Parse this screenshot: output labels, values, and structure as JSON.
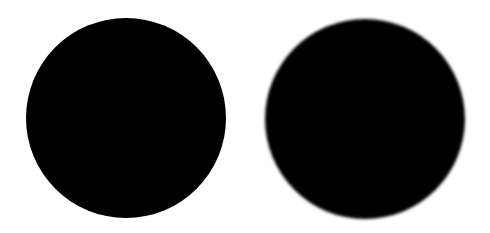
{
  "canvas": {
    "width": 490,
    "height": 233,
    "background": "#ffffff"
  },
  "shapes": [
    {
      "id": "sharp-circle",
      "type": "circle",
      "edge": "sharp",
      "cx": 126,
      "cy": 118,
      "r": 100,
      "color": "#000000"
    },
    {
      "id": "blurred-circle",
      "type": "circle",
      "edge": "blurred",
      "cx": 365,
      "cy": 119,
      "r": 100,
      "color": "#000000"
    }
  ]
}
